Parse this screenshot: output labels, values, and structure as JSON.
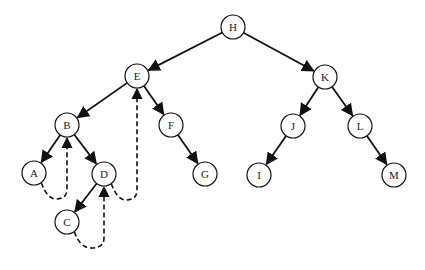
{
  "diagram": {
    "type": "binary-tree-threaded",
    "colors": {
      "stroke": "#111111",
      "node_fill": "#ffffff",
      "text": "#222222",
      "background": "#ffffff"
    },
    "nodes": [
      {
        "id": "H",
        "label": "H",
        "x": 233,
        "y": 27
      },
      {
        "id": "E",
        "label": "E",
        "x": 137,
        "y": 76
      },
      {
        "id": "K",
        "label": "K",
        "x": 325,
        "y": 77
      },
      {
        "id": "B",
        "label": "B",
        "x": 67,
        "y": 125
      },
      {
        "id": "F",
        "label": "F",
        "x": 171,
        "y": 125
      },
      {
        "id": "J",
        "label": "J",
        "x": 293,
        "y": 126
      },
      {
        "id": "L",
        "label": "L",
        "x": 360,
        "y": 126
      },
      {
        "id": "A",
        "label": "A",
        "x": 34,
        "y": 173
      },
      {
        "id": "D",
        "label": "D",
        "x": 104,
        "y": 174
      },
      {
        "id": "G",
        "label": "G",
        "x": 205,
        "y": 174
      },
      {
        "id": "I",
        "label": "I",
        "x": 259,
        "y": 175
      },
      {
        "id": "M",
        "label": "M",
        "x": 394,
        "y": 175
      },
      {
        "id": "C",
        "label": "C",
        "x": 67,
        "y": 222
      }
    ],
    "edges": [
      {
        "from": "H",
        "to": "E"
      },
      {
        "from": "H",
        "to": "K"
      },
      {
        "from": "E",
        "to": "B"
      },
      {
        "from": "E",
        "to": "F"
      },
      {
        "from": "K",
        "to": "J"
      },
      {
        "from": "K",
        "to": "L"
      },
      {
        "from": "B",
        "to": "A"
      },
      {
        "from": "B",
        "to": "D"
      },
      {
        "from": "F",
        "to": "G"
      },
      {
        "from": "J",
        "to": "I"
      },
      {
        "from": "L",
        "to": "M"
      },
      {
        "from": "D",
        "to": "C"
      }
    ],
    "threads": [
      {
        "from": "A",
        "to": "B",
        "style": "dashed"
      },
      {
        "from": "C",
        "to": "D",
        "style": "dashed"
      },
      {
        "from": "D",
        "to": "E",
        "style": "dashed"
      }
    ]
  }
}
